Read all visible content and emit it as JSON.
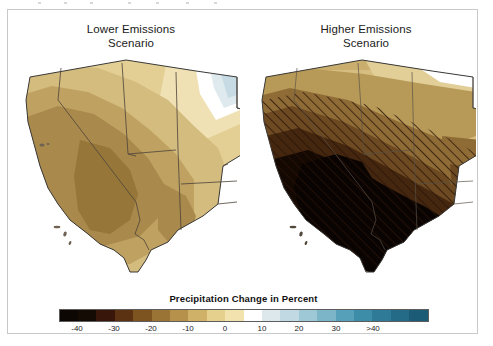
{
  "figure": {
    "panels": [
      {
        "id": "lower",
        "title": "Lower Emissions\nScenario"
      },
      {
        "id": "higher",
        "title": "Higher Emissions\nScenario"
      }
    ],
    "legend": {
      "title": "Precipitation Change in Percent",
      "tick_labels": [
        "-40",
        "-30",
        "-20",
        "-10",
        "0",
        "10",
        "20",
        "30",
        ">40"
      ],
      "swatch_colors": [
        "#0d0704",
        "#150b05",
        "#38170a",
        "#5b3212",
        "#7d541f",
        "#9a7434",
        "#b5914c",
        "#cfb168",
        "#e6d08e",
        "#f2e3ae",
        "#ffffff",
        "#dce8ec",
        "#c0d9e2",
        "#9fc8d6",
        "#7cb4c8",
        "#56a0b9",
        "#3d8da9",
        "#2f7b97",
        "#246b87",
        "#1b5b76"
      ]
    }
  },
  "chart_data": {
    "type": "heatmap",
    "title": "Precipitation Change in Percent",
    "subtitle": "Projected precipitation change for the Southwest United States",
    "panels": [
      {
        "name": "Lower Emissions Scenario",
        "description": "Moderate drying across most of the Southwest; driest core over southern Nevada / western Arizona; slight wetting in the far northeast corner.",
        "regions": [
          {
            "region": "Southern Nevada / Lower Colorado core",
            "value": -20
          },
          {
            "region": "Central California / Great Basin",
            "value": -14
          },
          {
            "region": "Southern Arizona",
            "value": -13
          },
          {
            "region": "Northern Nevada / Oregon border",
            "value": -8
          },
          {
            "region": "Utah",
            "value": -8
          },
          {
            "region": "Western Colorado",
            "value": -6
          },
          {
            "region": "New Mexico",
            "value": -10
          },
          {
            "region": "Northeast corner (eastern Colorado / Kansas)",
            "value": 6
          }
        ],
        "hatching": false
      },
      {
        "name": "Higher Emissions Scenario",
        "description": "Strong drying over nearly the whole domain; core exceeding -40 percent over southern California, southern Nevada, Arizona and southern New Mexico. Hatching indicates statistically significant change.",
        "regions": [
          {
            "region": "Southern California / Arizona / southern New Mexico core",
            "value": -42
          },
          {
            "region": "Southern Nevada",
            "value": -34
          },
          {
            "region": "Central California",
            "value": -28
          },
          {
            "region": "Utah",
            "value": -22
          },
          {
            "region": "Northern Nevada",
            "value": -16
          },
          {
            "region": "Western Colorado",
            "value": -14
          },
          {
            "region": "Oregon / Idaho border",
            "value": -9
          },
          {
            "region": "Northeastern plains edge",
            "value": -7
          }
        ],
        "hatching": true
      }
    ],
    "colorbar": {
      "label": "Precipitation Change in Percent",
      "ticks": [
        -40,
        -30,
        -20,
        -10,
        0,
        10,
        20,
        30,
        40
      ],
      "tick_labels": [
        "-40",
        "-30",
        "-20",
        "-10",
        "0",
        "10",
        "20",
        "30",
        ">40"
      ],
      "range": [
        -45,
        45
      ],
      "n_swatches": 20,
      "low_color": "#0d0704",
      "mid_color": "#ffffff",
      "high_color": "#1b5b76"
    },
    "legend_position": "bottom",
    "grid": false
  }
}
